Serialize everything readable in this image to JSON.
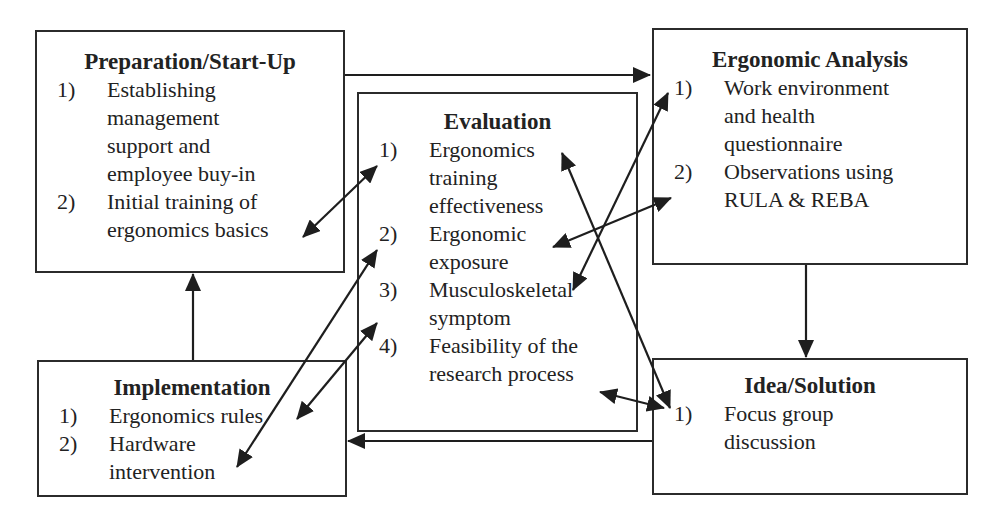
{
  "diagram": {
    "boxes": {
      "preparation": {
        "title": "Preparation/Start-Up",
        "items": [
          {
            "num": "1)",
            "text": "Establishing\nmanagement\nsupport and\nemployee buy-in"
          },
          {
            "num": "2)",
            "text": "Initial training of\nergonomics basics"
          }
        ]
      },
      "evaluation": {
        "title": "Evaluation",
        "items": [
          {
            "num": "1)",
            "text": "Ergonomics\ntraining\neffectiveness"
          },
          {
            "num": "2)",
            "text": "Ergonomic\nexposure"
          },
          {
            "num": "3)",
            "text": "Musculoskeletal\nsymptom"
          },
          {
            "num": "4)",
            "text": "Feasibility of the\nresearch process"
          }
        ]
      },
      "analysis": {
        "title": "Ergonomic Analysis",
        "items": [
          {
            "num": "1)",
            "text": "Work environment\nand health\nquestionnaire"
          },
          {
            "num": "2)",
            "text": "Observations using\nRULA & REBA"
          }
        ]
      },
      "implementation": {
        "title": "Implementation",
        "items": [
          {
            "num": "1)",
            "text": "Ergonomics rules"
          },
          {
            "num": "2)",
            "text": "Hardware\nintervention"
          }
        ]
      },
      "solution": {
        "title": "Idea/Solution",
        "items": [
          {
            "num": "1)",
            "text": "Focus group\ndiscussion"
          }
        ]
      }
    },
    "flow_arrows": [
      {
        "from": "Preparation/Start-Up",
        "to": "Ergonomic Analysis"
      },
      {
        "from": "Ergonomic Analysis",
        "to": "Idea/Solution"
      },
      {
        "from": "Idea/Solution",
        "to": "Implementation"
      },
      {
        "from": "Implementation",
        "to": "Preparation/Start-Up"
      }
    ],
    "link_arrows": [
      {
        "a": "Preparation 2) Initial training of ergonomics basics",
        "b": "Evaluation 1) Ergonomics training effectiveness"
      },
      {
        "a": "Evaluation 1) Ergonomics training effectiveness",
        "b": "Idea/Solution 1) Focus group discussion"
      },
      {
        "a": "Ergonomic Analysis 1) Work environment and health questionnaire",
        "b": "Evaluation 3) Musculoskeletal symptom"
      },
      {
        "a": "Ergonomic Analysis 2) Observations using RULA & REBA",
        "b": "Evaluation 2) Ergonomic exposure"
      },
      {
        "a": "Implementation 2) Hardware intervention",
        "b": "Evaluation 2) Ergonomic exposure"
      },
      {
        "a": "Implementation 1) Ergonomics rules",
        "b": "Evaluation 3) Musculoskeletal symptom"
      },
      {
        "a": "Evaluation 4) Feasibility of the research process",
        "b": "Idea/Solution 1) Focus group discussion"
      }
    ]
  }
}
